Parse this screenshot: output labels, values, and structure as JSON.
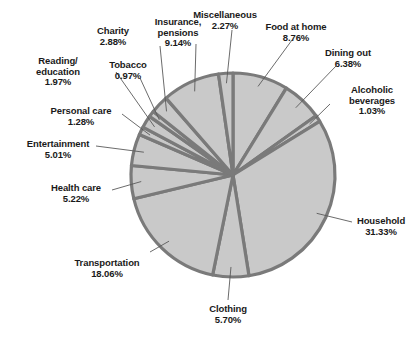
{
  "chart_data": {
    "type": "pie",
    "title": "",
    "subtitle": "",
    "xlabel": "",
    "ylabel": "",
    "legend_position": "none",
    "grid": false,
    "labels_show_percent": true,
    "start_angle_deg": 0,
    "direction": "clockwise",
    "categories": [
      "Food at home",
      "Dining out",
      "Alcoholic beverages",
      "Household",
      "Clothing",
      "Transportation",
      "Health care",
      "Entertainment",
      "Personal care",
      "Reading/ education",
      "Tobacco",
      "Charity",
      "Insurance, pensions",
      "Miscellaneous"
    ],
    "values": [
      8.76,
      6.38,
      1.03,
      31.33,
      5.7,
      18.06,
      5.22,
      5.01,
      1.28,
      1.97,
      0.97,
      2.88,
      9.14,
      2.27
    ],
    "total": 100.0,
    "units": "percent"
  },
  "colors": {
    "slice_fill": "#c9c9c9",
    "slice_stroke": "#7a7a7a",
    "outline": "#6f6f6f",
    "leader_line": "#5a5a5a",
    "text": "#1a1a1a",
    "background": "#ffffff"
  },
  "labels": [
    {
      "name": "food-at-home",
      "line1": "Food at home",
      "line2": "8.76%"
    },
    {
      "name": "dining-out",
      "line1": "Dining out",
      "line2": "6.38%"
    },
    {
      "name": "alcoholic-beverages",
      "line1": "Alcoholic",
      "line2": "beverages",
      "line3": "1.03%"
    },
    {
      "name": "household",
      "line1": "Household",
      "line2": "31.33%"
    },
    {
      "name": "clothing",
      "line1": "Clothing",
      "line2": "5.70%"
    },
    {
      "name": "transportation",
      "line1": "Transportation",
      "line2": "18.06%"
    },
    {
      "name": "health-care",
      "line1": "Health care",
      "line2": "5.22%"
    },
    {
      "name": "entertainment",
      "line1": "Entertainment",
      "line2": "5.01%"
    },
    {
      "name": "personal-care",
      "line1": "Personal care",
      "line2": "1.28%"
    },
    {
      "name": "reading-education",
      "line1": "Reading/",
      "line2": "education",
      "line3": "1.97%"
    },
    {
      "name": "tobacco",
      "line1": "Tobacco",
      "line2": "0.97%"
    },
    {
      "name": "charity",
      "line1": "Charity",
      "line2": "2.88%"
    },
    {
      "name": "insurance-pensions",
      "line1": "Insurance,",
      "line2": "pensions",
      "line3": "9.14%"
    },
    {
      "name": "miscellaneous",
      "line1": "Miscellaneous",
      "line2": "2.27%"
    }
  ]
}
